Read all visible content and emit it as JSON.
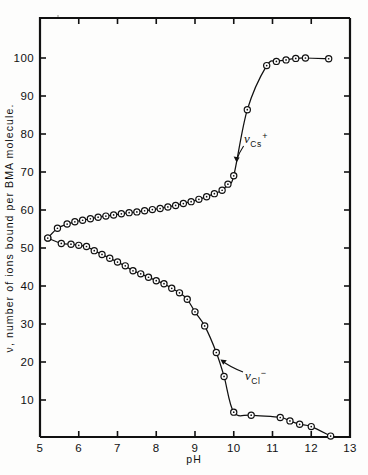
{
  "figure": {
    "name": "ion-binding-titration-plot",
    "background_color": "#fdfdfc",
    "ink_color": "#111111"
  },
  "chart_data": {
    "type": "line",
    "title": "",
    "subtitle": "",
    "xlabel": "pH",
    "ylabel": "ν, number of ions bound per BMA molecule.",
    "xlim": [
      5,
      13
    ],
    "ylim": [
      0,
      107
    ],
    "xticks": [
      5,
      6,
      7,
      8,
      9,
      10,
      11,
      12,
      13
    ],
    "xticklabels": [
      "5",
      "6",
      "7",
      "8",
      "9",
      "10",
      "11",
      "12",
      "13"
    ],
    "yticks": [
      10,
      20,
      30,
      40,
      50,
      60,
      70,
      80,
      90,
      100
    ],
    "yticklabels": [
      "10",
      "20",
      "30",
      "40",
      "50",
      "60",
      "70",
      "80",
      "90",
      "100"
    ],
    "grid": false,
    "legend_position": "inline-annotation",
    "marker": "open-circle-with-dot",
    "series": [
      {
        "name": "ν_Cs+",
        "label_base": "ν",
        "label_sub": "Cs",
        "label_sup": "+",
        "annotation_x": 10.45,
        "annotation_y": 79,
        "points": [
          {
            "x": 5.2,
            "y": 52.6
          },
          {
            "x": 5.45,
            "y": 55.2
          },
          {
            "x": 5.7,
            "y": 56.3
          },
          {
            "x": 5.9,
            "y": 56.9
          },
          {
            "x": 6.1,
            "y": 57.3
          },
          {
            "x": 6.3,
            "y": 57.7
          },
          {
            "x": 6.5,
            "y": 58.1
          },
          {
            "x": 6.7,
            "y": 58.4
          },
          {
            "x": 6.9,
            "y": 58.7
          },
          {
            "x": 7.1,
            "y": 59.0
          },
          {
            "x": 7.3,
            "y": 59.3
          },
          {
            "x": 7.5,
            "y": 59.5
          },
          {
            "x": 7.7,
            "y": 59.8
          },
          {
            "x": 7.9,
            "y": 60.1
          },
          {
            "x": 8.1,
            "y": 60.4
          },
          {
            "x": 8.3,
            "y": 60.8
          },
          {
            "x": 8.5,
            "y": 61.2
          },
          {
            "x": 8.7,
            "y": 61.7
          },
          {
            "x": 8.9,
            "y": 62.2
          },
          {
            "x": 9.1,
            "y": 62.8
          },
          {
            "x": 9.3,
            "y": 63.5
          },
          {
            "x": 9.5,
            "y": 64.3
          },
          {
            "x": 9.7,
            "y": 65.2
          },
          {
            "x": 9.85,
            "y": 66.8
          },
          {
            "x": 10.0,
            "y": 69.0
          },
          {
            "x": 10.35,
            "y": 86.4
          },
          {
            "x": 10.85,
            "y": 98.0
          },
          {
            "x": 11.1,
            "y": 99.1
          },
          {
            "x": 11.35,
            "y": 99.5
          },
          {
            "x": 11.6,
            "y": 99.9
          },
          {
            "x": 11.85,
            "y": 100.0
          },
          {
            "x": 12.45,
            "y": 99.8
          }
        ]
      },
      {
        "name": "ν_Cl-",
        "label_base": "ν",
        "label_sub": "Cl",
        "label_sup": "−",
        "annotation_x": 10.75,
        "annotation_y": 15.5,
        "points": [
          {
            "x": 5.2,
            "y": 52.6
          },
          {
            "x": 5.55,
            "y": 51.2
          },
          {
            "x": 5.8,
            "y": 51.0
          },
          {
            "x": 6.0,
            "y": 50.7
          },
          {
            "x": 6.2,
            "y": 50.4
          },
          {
            "x": 6.4,
            "y": 49.3
          },
          {
            "x": 6.6,
            "y": 48.3
          },
          {
            "x": 6.8,
            "y": 47.3
          },
          {
            "x": 7.0,
            "y": 46.3
          },
          {
            "x": 7.2,
            "y": 45.3
          },
          {
            "x": 7.4,
            "y": 44.0
          },
          {
            "x": 7.6,
            "y": 43.2
          },
          {
            "x": 7.8,
            "y": 42.3
          },
          {
            "x": 8.0,
            "y": 41.4
          },
          {
            "x": 8.2,
            "y": 40.6
          },
          {
            "x": 8.4,
            "y": 39.4
          },
          {
            "x": 8.6,
            "y": 38.2
          },
          {
            "x": 8.8,
            "y": 36.5
          },
          {
            "x": 9.0,
            "y": 33.2
          },
          {
            "x": 9.25,
            "y": 29.5
          },
          {
            "x": 9.55,
            "y": 22.5
          },
          {
            "x": 9.75,
            "y": 16.2
          },
          {
            "x": 10.0,
            "y": 6.8
          },
          {
            "x": 10.45,
            "y": 6.0
          },
          {
            "x": 11.2,
            "y": 5.4
          },
          {
            "x": 11.45,
            "y": 4.5
          },
          {
            "x": 11.7,
            "y": 3.6
          },
          {
            "x": 12.0,
            "y": 3.0
          },
          {
            "x": 12.5,
            "y": 0.5
          }
        ]
      }
    ]
  }
}
